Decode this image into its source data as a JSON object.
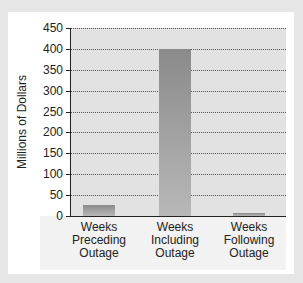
{
  "chart_data": {
    "type": "bar",
    "title": "",
    "xlabel": "",
    "ylabel": "Millions of Dollars",
    "ylim": [
      0,
      450
    ],
    "yticks": [
      0,
      50,
      100,
      150,
      200,
      250,
      300,
      350,
      400,
      450
    ],
    "grid": true,
    "categories": [
      "Weeks Preceding Outage",
      "Weeks Including Outage",
      "Weeks Following Outage"
    ],
    "category_lines": [
      [
        "Weeks",
        "Preceding",
        "Outage"
      ],
      [
        "Weeks",
        "Including",
        "Outage"
      ],
      [
        "Weeks",
        "Following",
        "Outage"
      ]
    ],
    "values": [
      27,
      400,
      8
    ],
    "legend": null
  },
  "colors": {
    "bar": "#9a9a9a",
    "plot_bg": "#e2e2e2",
    "panel_bg": "#ffffff",
    "frame_bg": "#e6e6e6"
  }
}
